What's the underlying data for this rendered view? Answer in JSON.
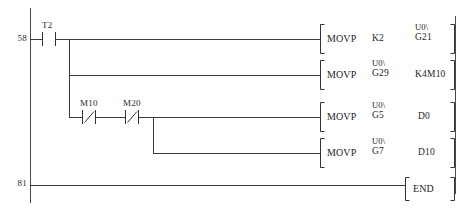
{
  "diagram": {
    "kind": "ladder-logic",
    "vendor_notation": "Mitsubishi",
    "left_rail_label": "left-power-rail",
    "right_rail_label": "right-power-rail"
  },
  "steps": [
    {
      "number": "58"
    },
    {
      "number": "81"
    }
  ],
  "contacts": [
    {
      "name": "T2",
      "type": "normally-open",
      "label": "T2"
    },
    {
      "name": "M10",
      "type": "normally-closed",
      "label": "M10"
    },
    {
      "name": "M20",
      "type": "normally-closed",
      "label": "M20"
    }
  ],
  "rungs": [
    {
      "id": "rung-1",
      "instruction": "MOVP",
      "source": {
        "prefix": "",
        "device": "K2"
      },
      "destination": {
        "prefix": "U0\\",
        "device": "G21"
      }
    },
    {
      "id": "rung-2",
      "instruction": "MOVP",
      "source": {
        "prefix": "U0\\",
        "device": "G29"
      },
      "destination": {
        "prefix": "",
        "device": "K4M10"
      }
    },
    {
      "id": "rung-3",
      "instruction": "MOVP",
      "source": {
        "prefix": "U0\\",
        "device": "G5"
      },
      "destination": {
        "prefix": "",
        "device": "D0"
      }
    },
    {
      "id": "rung-4",
      "instruction": "MOVP",
      "source": {
        "prefix": "U0\\",
        "device": "G7"
      },
      "destination": {
        "prefix": "",
        "device": "D10"
      }
    },
    {
      "id": "rung-end",
      "instruction": "END",
      "source": {
        "prefix": "",
        "device": ""
      },
      "destination": {
        "prefix": "",
        "device": ""
      }
    }
  ],
  "colors": {
    "line": "#3a3a3a",
    "text": "#1e1e1e",
    "background": "#ffffff"
  }
}
